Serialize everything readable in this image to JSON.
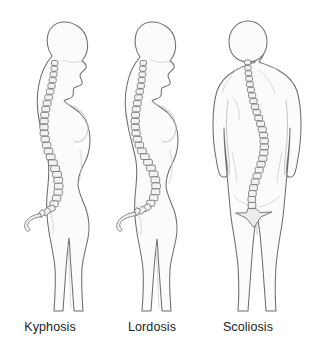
{
  "illustration": {
    "title": "Spinal curvature disorders comparison",
    "background_color": "#ffffff",
    "outline_color": "#6d6d6d",
    "body_fill_color": "#fbfbfb",
    "vertebra_fill_color": "#f2f2f2",
    "label_color": "#1d1d1d",
    "figure_count": 3
  },
  "figures": [
    {
      "id": "kyphosis",
      "label": "Kyphosis",
      "view": "lateral-left-profile",
      "sex_presentation": "female",
      "label_x": 50,
      "label_y": 331,
      "description": "Exaggerated outward rounding of the thoracic spine producing a hunched upper back",
      "spine_region_affected": "thoracic",
      "vertebra_count": 30,
      "has_sacrum_triangle": false,
      "has_coccyx_hook": true
    },
    {
      "id": "lordosis",
      "label": "Lordosis",
      "view": "lateral-left-profile",
      "sex_presentation": "female",
      "label_x": 152,
      "label_y": 331,
      "description": "Exaggerated inward curve of the lumbar spine producing a swayback posture",
      "spine_region_affected": "lumbar",
      "vertebra_count": 30,
      "has_sacrum_triangle": false,
      "has_coccyx_hook": true
    },
    {
      "id": "scoliosis",
      "label": "Scoliosis",
      "view": "posterior-coronal",
      "sex_presentation": "neutral",
      "label_x": 248,
      "label_y": 331,
      "description": "Sideways S-shaped lateral curvature of the spine seen from behind",
      "spine_region_affected": "thoracolumbar",
      "vertebra_count": 31,
      "has_sacrum_triangle": true,
      "has_coccyx_hook": false
    }
  ],
  "labels": {
    "kyphosis": "Kyphosis",
    "lordosis": "Lordosis",
    "scoliosis": "Scoliosis"
  }
}
